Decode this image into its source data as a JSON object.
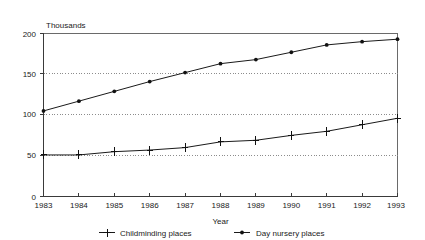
{
  "chart_data": {
    "type": "line",
    "title": "",
    "subtitle": "",
    "unit_label": "Thousands",
    "xlabel": "Year",
    "ylabel": "",
    "categories": [
      "1983",
      "1984",
      "1985",
      "1986",
      "1987",
      "1988",
      "1989",
      "1990",
      "1991",
      "1992",
      "1993"
    ],
    "x": [
      1983,
      1984,
      1985,
      1986,
      1987,
      1988,
      1989,
      1990,
      1991,
      1992,
      1993
    ],
    "series": [
      {
        "name": "Childminding places",
        "marker": "plus",
        "values": [
          51,
          51,
          55,
          57,
          60,
          67,
          69,
          75,
          80,
          88,
          96
        ]
      },
      {
        "name": "Day nursery places",
        "marker": "dot",
        "values": [
          105,
          117,
          129,
          141,
          152,
          163,
          168,
          177,
          186,
          190,
          193
        ]
      }
    ],
    "ylim": [
      0,
      200
    ],
    "yticks": [
      0,
      50,
      100,
      150,
      200
    ],
    "ytick_labels": [
      "0",
      "50",
      "100",
      "150",
      "200"
    ],
    "xlim": [
      1983,
      1993
    ],
    "grid": true,
    "grid_axis": "y",
    "legend_position": "bottom",
    "colors": {
      "line": "#1a1a1a",
      "grid": "#8c8c8c",
      "axis": "#3a3a3a",
      "background": "#ffffff"
    }
  },
  "legend": {
    "items": [
      {
        "label": "Childminding places",
        "marker": "plus"
      },
      {
        "label": "Day nursery places",
        "marker": "dot"
      }
    ]
  },
  "axes": {
    "x_title": "Year",
    "y_unit": "Thousands"
  }
}
